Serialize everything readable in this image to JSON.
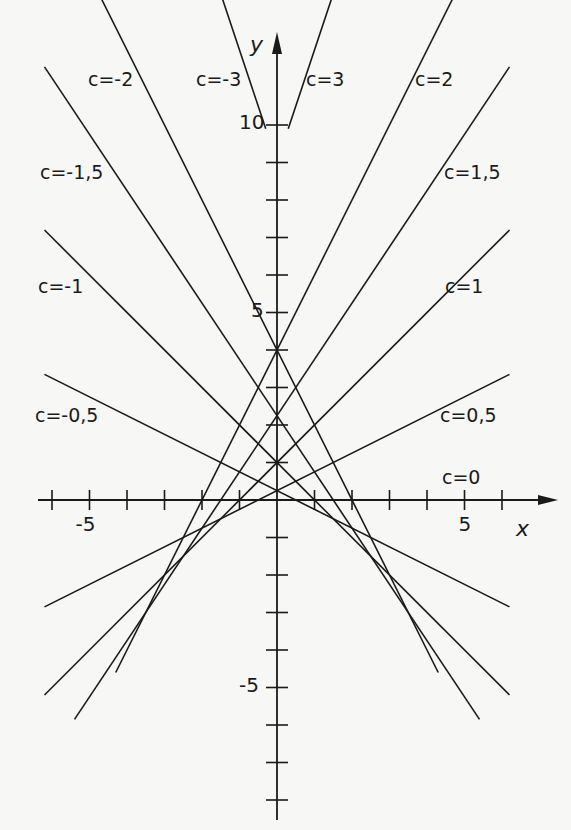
{
  "figure": {
    "colors": {
      "ink": "#1a1a1a",
      "paper": "#f7f7f5"
    }
  },
  "axes": {
    "x_label": "x",
    "y_label": "y",
    "x_ticks": [
      -6,
      -5,
      -4,
      -3,
      -2,
      -1,
      1,
      2,
      3,
      4,
      5,
      6
    ],
    "y_ticks": [
      -8,
      -7,
      -6,
      -5,
      -4,
      -3,
      -2,
      -1,
      1,
      2,
      3,
      4,
      5,
      6,
      7,
      8,
      9,
      10
    ],
    "x_tick_labels": [
      {
        "value": -5,
        "text": "-5"
      },
      {
        "value": 5,
        "text": "5"
      }
    ],
    "y_tick_labels": [
      {
        "value": 10,
        "text": "10"
      },
      {
        "value": 5,
        "text": "5"
      },
      {
        "value": -5,
        "text": "-5"
      }
    ],
    "xlim": [
      -6.3,
      6.3
    ],
    "ylim": [
      -9.7,
      11.0
    ]
  },
  "lines": [
    {
      "c": -3,
      "label": "c=-3",
      "label_pos": [
        196,
        70
      ]
    },
    {
      "c": -2,
      "label": "c=-2",
      "label_pos": [
        88,
        70
      ]
    },
    {
      "c": -1.5,
      "label": "c=-1,5",
      "label_pos": [
        40,
        163
      ]
    },
    {
      "c": -1,
      "label": "c=-1",
      "label_pos": [
        38,
        277
      ]
    },
    {
      "c": -0.5,
      "label": "c=-0,5",
      "label_pos": [
        35,
        406
      ]
    },
    {
      "c": 0,
      "label": "c=0",
      "label_pos": [
        442,
        468
      ]
    },
    {
      "c": 0.5,
      "label": "c=0,5",
      "label_pos": [
        440,
        406
      ]
    },
    {
      "c": 1,
      "label": "c=1",
      "label_pos": [
        445,
        277
      ]
    },
    {
      "c": 1.5,
      "label": "c=1,5",
      "label_pos": [
        444,
        163
      ]
    },
    {
      "c": 2,
      "label": "c=2",
      "label_pos": [
        415,
        70
      ]
    },
    {
      "c": 3,
      "label": "c=3",
      "label_pos": [
        306,
        70
      ]
    }
  ],
  "line_extents": {
    "-3": [
      -6.25,
      -0.3
    ],
    "-2": [
      -4.7,
      4.3
    ],
    "-1.5": [
      -6.2,
      5.4
    ],
    "-1": [
      -6.2,
      6.2
    ],
    "-0.5": [
      -6.2,
      6.2
    ],
    "0": [
      -6.0,
      6.0
    ],
    "0.5": [
      -6.2,
      6.2
    ],
    "1": [
      -6.2,
      6.2
    ],
    "1.5": [
      -5.4,
      6.2
    ],
    "2": [
      -4.3,
      4.7
    ],
    "3": [
      0.3,
      6.25
    ]
  }
}
